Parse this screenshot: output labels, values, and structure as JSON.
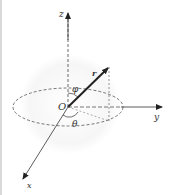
{
  "diagram": {
    "labels": {
      "z_axis": "z",
      "y_axis": "y",
      "x_axis": "x",
      "origin": "O",
      "radius_vector": "r",
      "polar_angle": "φ",
      "azimuth_angle": "θ"
    },
    "colors": {
      "line": "#333333",
      "dashed": "#555555",
      "sphere_shade": "#f3f3f3",
      "border": "#d9d9d9"
    }
  }
}
